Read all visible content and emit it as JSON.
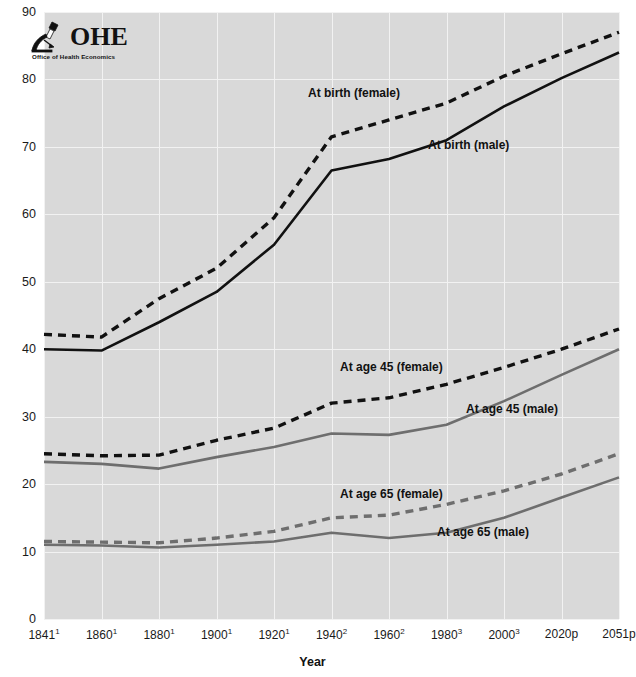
{
  "logo": {
    "name": "OHE",
    "subtitle": "Office of Health Economics",
    "icon": "microscope-icon"
  },
  "axes": {
    "y_ticks": [
      "90",
      "80",
      "70",
      "60",
      "50",
      "40",
      "30",
      "20",
      "10",
      "0"
    ],
    "x_ticks": [
      {
        "year": "1841",
        "note": "1"
      },
      {
        "year": "1860",
        "note": "1"
      },
      {
        "year": "1880",
        "note": "1"
      },
      {
        "year": "1900",
        "note": "1"
      },
      {
        "year": "1920",
        "note": "1"
      },
      {
        "year": "1940",
        "note": "2"
      },
      {
        "year": "1960",
        "note": "2"
      },
      {
        "year": "1980",
        "note": "3"
      },
      {
        "year": "2000",
        "note": "3"
      },
      {
        "year": "2020p",
        "note": ""
      },
      {
        "year": "2051p",
        "note": ""
      }
    ],
    "x_title": "Year"
  },
  "annotations": [
    {
      "text": "At birth (female)",
      "x": 308,
      "y": 86
    },
    {
      "text": "At birth (male)",
      "x": 428,
      "y": 138
    },
    {
      "text": "At age 45 (female)",
      "x": 340,
      "y": 360
    },
    {
      "text": "At age 45 (male)",
      "x": 466,
      "y": 402
    },
    {
      "text": "At age 65 (female)",
      "x": 340,
      "y": 487
    },
    {
      "text": "At age 65 (male)",
      "x": 437,
      "y": 525
    }
  ],
  "colors": {
    "plot_background": "#d9d9d9",
    "gridline": "#f2f2f2",
    "birth_series": "#111111",
    "age45_series": "#6e6e6e",
    "age65_series": "#6e6e6e",
    "text": "#1a1a1a"
  },
  "chart_data": {
    "type": "line",
    "title": "",
    "xlabel": "Year",
    "ylabel": "",
    "ylim": [
      0,
      90
    ],
    "ytick_step": 10,
    "grid": true,
    "legend": "inline-annotations",
    "x": [
      "1841",
      "1860",
      "1880",
      "1900",
      "1920",
      "1940",
      "1960",
      "1980",
      "2000",
      "2020p",
      "2051p"
    ],
    "series": [
      {
        "name": "At birth (female)",
        "style": "dashed",
        "color": "#111111",
        "values": [
          42.2,
          41.8,
          47.5,
          52.0,
          59.5,
          71.5,
          74.0,
          76.5,
          80.5,
          83.8,
          87.0
        ]
      },
      {
        "name": "At birth (male)",
        "style": "solid",
        "color": "#111111",
        "values": [
          40.0,
          39.8,
          44.0,
          48.5,
          55.5,
          66.5,
          68.2,
          71.0,
          76.0,
          80.2,
          84.0
        ]
      },
      {
        "name": "At age 45 (female)",
        "style": "dashed",
        "color": "#111111",
        "values": [
          24.5,
          24.2,
          24.3,
          26.5,
          28.3,
          32.0,
          32.8,
          34.8,
          37.3,
          40.0,
          43.0
        ]
      },
      {
        "name": "At age 45 (male)",
        "style": "solid",
        "color": "#6e6e6e",
        "values": [
          23.3,
          23.0,
          22.3,
          24.0,
          25.5,
          27.5,
          27.3,
          28.8,
          32.3,
          36.2,
          40.0
        ]
      },
      {
        "name": "At age 65 (female)",
        "style": "dashed",
        "color": "#6e6e6e",
        "values": [
          11.5,
          11.4,
          11.3,
          12.0,
          13.0,
          15.0,
          15.4,
          17.0,
          19.0,
          21.5,
          24.5
        ]
      },
      {
        "name": "At age 65 (male)",
        "style": "solid",
        "color": "#6e6e6e",
        "values": [
          11.0,
          10.9,
          10.6,
          11.0,
          11.5,
          12.8,
          12.0,
          12.8,
          15.0,
          18.0,
          21.0
        ]
      }
    ]
  }
}
